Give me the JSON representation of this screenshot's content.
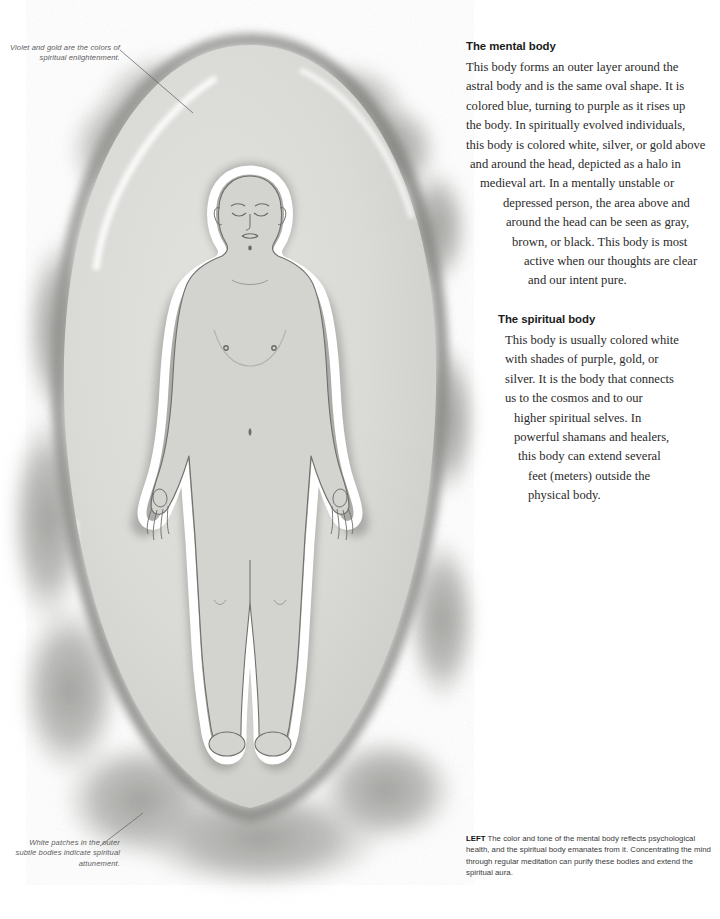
{
  "annotations": {
    "top_left": "Violet and gold are the colors of spiritual enlightenment.",
    "bottom_left": "White patches in the outer subtle bodies indicate spiritual attunement."
  },
  "sections": [
    {
      "heading": "The mental body",
      "lines": [
        "This body forms an outer layer around the",
        "astral body and is the same oval shape. It is",
        "colored blue, turning to purple as it rises up",
        "the body. In spiritually evolved individuals,",
        "this body is colored white, silver, or gold above",
        "and around the head, depicted as a halo in",
        "medieval art. In a mentally unstable or",
        "depressed person, the area above and",
        "around the head can be seen as gray,",
        "brown, or black. This body is most",
        "active when our thoughts are clear",
        "and our intent pure."
      ]
    },
    {
      "heading": "The spiritual body",
      "lines": [
        "This body is usually colored white",
        "with shades of purple, gold, or",
        "silver. It is the body that connects",
        "us to the cosmos and to our",
        "higher spiritual selves. In",
        "powerful shamans and healers,",
        "this body can extend several",
        "feet (meters) outside the",
        "physical body."
      ]
    }
  ],
  "caption": {
    "lead": "LEFT",
    "text": " The color and tone of the mental body reflects psychological health, and the spiritual body emanates from it. Concentrating the mind through regular meditation can purify these bodies and extend the spiritual aura."
  },
  "illustration": {
    "title": "Grayscale watercolor of a human figure within an oval aura",
    "colors": {
      "aura_fill": "#d9d9d6",
      "aura_rim": "#8d8d8a",
      "cloud_patch": "#a9a9a6",
      "body_fill": "#d2d2ce",
      "body_outline": "#6f6f6c",
      "spiritual_white": "#ffffff",
      "shadow_layer": "#9e9e9b",
      "leader_line": "#6a6a6a"
    }
  }
}
